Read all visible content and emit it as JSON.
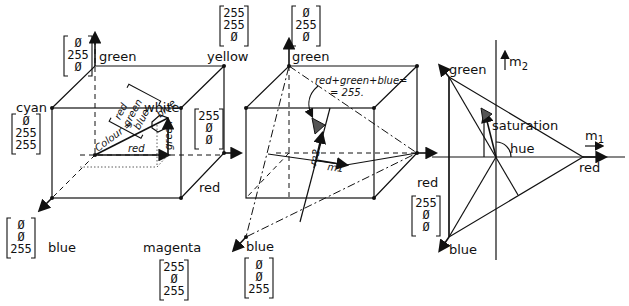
{
  "cube1": {
    "labels": {
      "green": "green",
      "yellow": "yellow",
      "cyan": "cyan",
      "white": "white",
      "red": "red",
      "blue": "blue",
      "magenta": "magenta"
    },
    "vectors": {
      "green": [
        "Ø",
        "255",
        "Ø"
      ],
      "yellow": [
        "255",
        "255",
        "Ø"
      ],
      "cyan": [
        "Ø",
        "255",
        "255"
      ],
      "red": [
        "255",
        "Ø",
        "Ø"
      ],
      "blue": [
        "Ø",
        "Ø",
        "255"
      ],
      "magenta": [
        "255",
        "Ø",
        "255"
      ]
    },
    "inner": {
      "colour_eq": "Colour =",
      "vec": [
        "red",
        "green",
        "blue"
      ],
      "axis_red": "red",
      "axis_green": "green",
      "axis_blue": "blue"
    }
  },
  "cube2": {
    "labels": {
      "green": "green",
      "red": "red",
      "blue": "blue",
      "m1": "m1",
      "m2": "m2"
    },
    "vectors": {
      "green": [
        "Ø",
        "255",
        "Ø"
      ],
      "red": [
        "255",
        "Ø",
        "Ø"
      ],
      "blue": [
        "Ø",
        "Ø",
        "255"
      ]
    },
    "plane_eq_line1": "red+green+blue=",
    "plane_eq_line2": "= 255."
  },
  "plane": {
    "labels": {
      "green": "green",
      "red": "red",
      "blue": "blue",
      "m1": "m",
      "m1_sub": "1",
      "m2": "m",
      "m2_sub": "2",
      "saturation": "saturation",
      "hue": "hue"
    }
  }
}
